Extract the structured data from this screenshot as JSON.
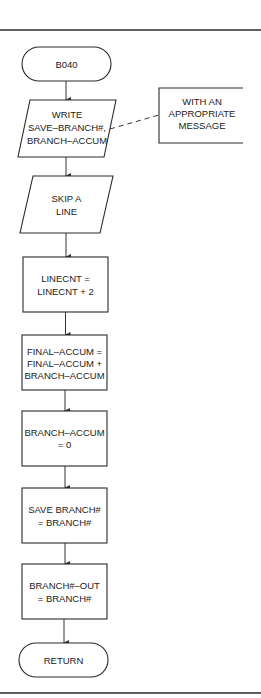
{
  "flowchart": {
    "start_terminal": {
      "label": "B040"
    },
    "steps": [
      {
        "type": "io",
        "lines": [
          "WRITE",
          "SAVE–BRANCH#,",
          "BRANCH–ACCUM"
        ]
      },
      {
        "type": "io",
        "lines": [
          "SKIP A",
          "LINE"
        ]
      },
      {
        "type": "process",
        "lines": [
          "LINECNT =",
          "LINECNT + 2"
        ]
      },
      {
        "type": "process",
        "lines": [
          "FINAL–ACCUM =",
          "FINAL–ACCUM +",
          "BRANCH–ACCUM"
        ]
      },
      {
        "type": "process",
        "lines": [
          "BRANCH–ACCUM",
          "= 0"
        ]
      },
      {
        "type": "process",
        "lines": [
          "SAVE BRANCH#",
          "= BRANCH#"
        ]
      },
      {
        "type": "process",
        "lines": [
          "BRANCH#–OUT",
          "= BRANCH#"
        ]
      }
    ],
    "annotation": {
      "attached_to_step": 0,
      "lines": [
        "WITH AN",
        "APPROPRIATE",
        "MESSAGE"
      ]
    },
    "end_terminal": {
      "label": "RETURN"
    }
  },
  "colors": {
    "stroke": "#2a2a2a",
    "background": "#ffffff",
    "text": "#222222"
  }
}
